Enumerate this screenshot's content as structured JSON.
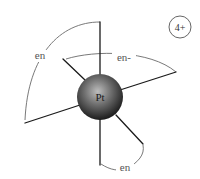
{
  "diagram": {
    "metal": {
      "symbol": "Pt",
      "color": "#2e2e2e"
    },
    "charge": "4+",
    "ligands": [
      {
        "label": "en",
        "description": "ethylenediamine bridging top and lower-left bonds"
      },
      {
        "label": "en-",
        "description": "ethylenediamine bridging upper-left and right bonds"
      },
      {
        "label": "en",
        "description": "ethylenediamine bridging bottom and lower-right bonds"
      }
    ]
  }
}
